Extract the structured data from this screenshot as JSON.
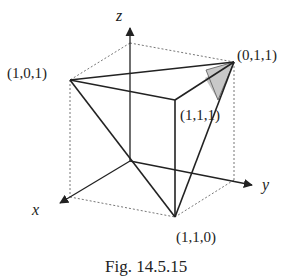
{
  "figure": {
    "caption": "Fig. 14.5.15",
    "axes": {
      "x": "x",
      "y": "y",
      "z": "z"
    },
    "vertices": {
      "v101": "(1,0,1)",
      "v011": "(0,1,1)",
      "v111": "(1,1,1)",
      "v110": "(1,1,0)"
    },
    "colors": {
      "line": "#222222",
      "dotted": "#777777",
      "shade": "#c8c8c8"
    }
  }
}
